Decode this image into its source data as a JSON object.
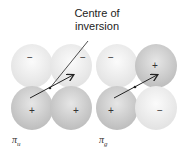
{
  "annotation": {
    "line1": "Centre of",
    "line2": "inversion"
  },
  "orbitals": [
    {
      "name": "pi_u",
      "symbol": "π",
      "subscript": "u",
      "signs": {
        "upper_left": "−",
        "upper_right": "−",
        "lower_left": "+",
        "lower_right": "+"
      }
    },
    {
      "name": "pi_g",
      "symbol": "π",
      "subscript": "g",
      "signs": {
        "upper_left": "−",
        "upper_right": "+",
        "lower_left": "+",
        "lower_right": "−"
      }
    }
  ],
  "colors": {
    "lobe_light": "#f4f4f4",
    "lobe_dark": "#d2d2d2",
    "line": "#222222"
  }
}
